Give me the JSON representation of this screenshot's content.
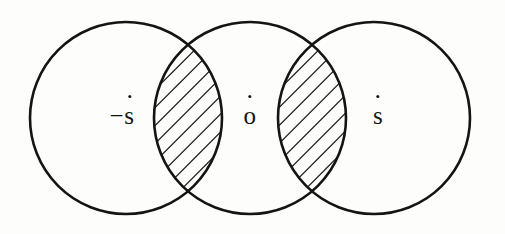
{
  "figure": {
    "kind": "venn-diagram",
    "width": 505,
    "height": 234,
    "background_color": "#fdfdfc",
    "stroke_color": "#141414",
    "hatch_color": "#1c1c1c",
    "title": ""
  },
  "circles": [
    {
      "name": "left-circle",
      "cx": 126,
      "cy": 118,
      "r": 96
    },
    {
      "name": "middle-circle",
      "cx": 250,
      "cy": 118,
      "r": 96
    },
    {
      "name": "right-circle",
      "cx": 374,
      "cy": 118,
      "r": 96
    }
  ],
  "lenses": [
    {
      "name": "left-lens",
      "hatched": true,
      "hatch_direction": "forward-slash",
      "between": [
        "left-circle",
        "middle-circle"
      ],
      "cx": 188,
      "top_y": 45,
      "bottom_y": 191
    },
    {
      "name": "right-lens",
      "hatched": true,
      "hatch_direction": "forward-slash",
      "between": [
        "middle-circle",
        "right-circle"
      ],
      "cx": 312,
      "top_y": 45,
      "bottom_y": 191
    }
  ],
  "labels": {
    "left": {
      "text": "−s",
      "dot": "·",
      "x": 122,
      "y": 120
    },
    "middle": {
      "text": "o",
      "dot": "·",
      "x": 250,
      "y": 120
    },
    "right": {
      "text": "s",
      "dot": "·",
      "x": 378,
      "y": 120
    }
  }
}
